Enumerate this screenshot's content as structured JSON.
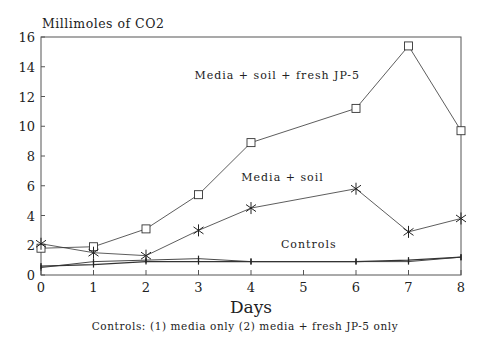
{
  "chart_data": {
    "type": "line",
    "title": "",
    "ylabel": "Millimoles of CO2",
    "xlabel": "Days",
    "footnote": "Controls:  (1) media only      (2) media + fresh JP-5 only",
    "x": [
      0,
      1,
      2,
      3,
      4,
      6,
      7,
      8
    ],
    "xticks": [
      "0",
      "1",
      "2",
      "3",
      "4",
      "5",
      "6",
      "7",
      "8"
    ],
    "yticks": [
      "0",
      "2",
      "4",
      "6",
      "8",
      "10",
      "12",
      "14",
      "16"
    ],
    "xlim": [
      0,
      8
    ],
    "ylim": [
      0,
      16
    ],
    "grid": false,
    "series": [
      {
        "name": "Media + soil + fresh JP-5",
        "marker": "square",
        "values": [
          1.8,
          1.9,
          3.1,
          5.4,
          8.9,
          11.2,
          15.4,
          9.7
        ]
      },
      {
        "name": "Media + soil",
        "marker": "asterisk",
        "values": [
          2.1,
          1.5,
          1.3,
          3.0,
          4.5,
          5.8,
          2.9,
          3.8
        ]
      },
      {
        "name": "Controls (1) media only",
        "marker": "plus",
        "values": [
          0.5,
          0.9,
          1.0,
          1.1,
          0.9,
          0.9,
          0.9,
          1.2
        ]
      },
      {
        "name": "Controls (2) media + fresh JP-5 only",
        "marker": "plus",
        "values": [
          0.6,
          0.7,
          0.9,
          0.9,
          0.9,
          0.9,
          1.0,
          1.2
        ]
      }
    ],
    "annotations": [
      {
        "text": "Media + soil + fresh JP-5",
        "x": 4.5,
        "y": 13.2
      },
      {
        "text": "Media + soil",
        "x": 4.6,
        "y": 6.3
      },
      {
        "text": "Controls",
        "x": 5.1,
        "y": 1.8
      }
    ]
  }
}
